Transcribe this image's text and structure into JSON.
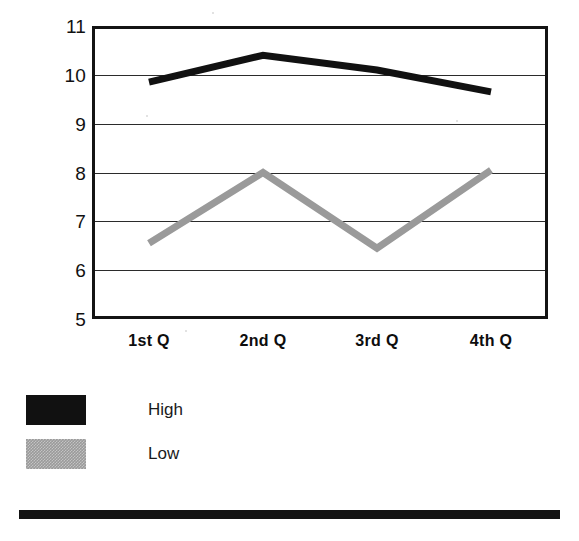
{
  "chart_data": {
    "type": "line",
    "title": "",
    "subtitle": "",
    "xlabel": "",
    "ylabel": "",
    "categories": [
      "1st Q",
      "2nd Q",
      "3rd Q",
      "4th Q"
    ],
    "series": [
      {
        "name": "High",
        "color": "#111111",
        "values": [
          9.85,
          10.4,
          10.1,
          9.65
        ]
      },
      {
        "name": "Low",
        "color": "#9a9a9a",
        "values": [
          6.55,
          8.0,
          6.45,
          8.05
        ]
      }
    ],
    "ylim": [
      5,
      11
    ],
    "yticks": [
      5,
      6,
      7,
      8,
      9,
      10,
      11
    ],
    "ytick_labels": [
      "5",
      "6",
      "7",
      "8",
      "9",
      "10",
      "11"
    ],
    "grid": true,
    "grid_axis": "y",
    "legend": {
      "position": "below-left",
      "entries": [
        "High",
        "Low"
      ]
    }
  },
  "axes": {
    "y_labels": [
      "11",
      "10",
      "9",
      "8",
      "7",
      "6",
      "5"
    ],
    "x_labels": [
      "1st Q",
      "2nd Q",
      "3rd Q",
      "4th Q"
    ]
  },
  "legend": {
    "entries": [
      {
        "label": "High",
        "swatch": "black-swatch"
      },
      {
        "label": "Low",
        "swatch": "gray-swatch"
      }
    ]
  },
  "decoration": {
    "bottom_rule_color": "#131313"
  }
}
